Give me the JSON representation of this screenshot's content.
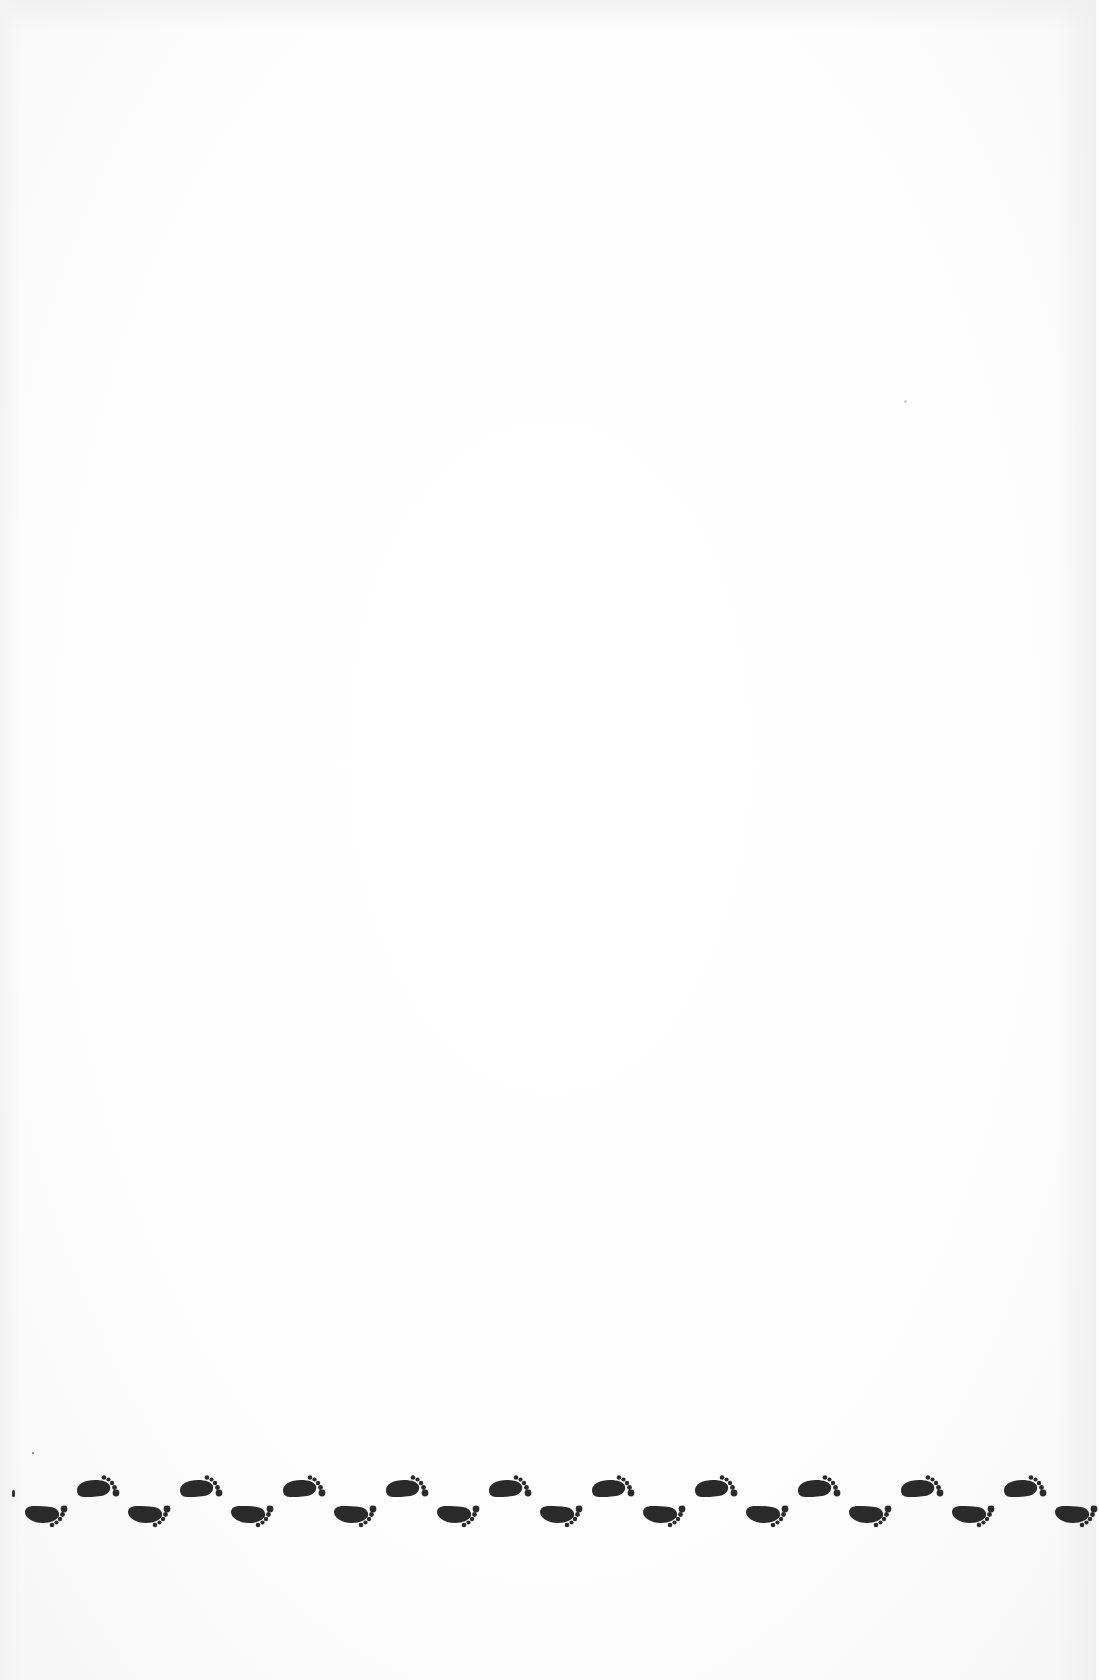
{
  "page": {
    "type": "blank book page",
    "background_color": "#fdfdfd"
  },
  "footprint_border": {
    "ink_color": "#2a2a2a",
    "upper_row": {
      "count": 10,
      "start_x": 75,
      "spacing": 103,
      "top_y": 1473,
      "direction": "right"
    },
    "lower_row": {
      "count": 11,
      "start_x": 23,
      "spacing": 103,
      "top_y": 1500,
      "direction": "right"
    }
  }
}
